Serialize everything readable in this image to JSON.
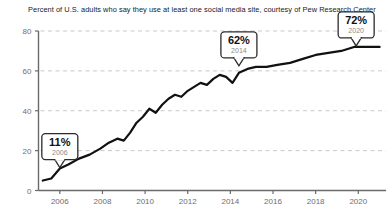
{
  "chart_data": {
    "type": "line",
    "title": "Percent of U.S. adults who say they use at least one social media site, courtesy of Pew Research Center",
    "xlabel": "",
    "ylabel": "",
    "xlim": [
      2005.0,
      2021.3
    ],
    "ylim": [
      0,
      80
    ],
    "grid": true,
    "legend": "none",
    "y_ticks": [
      0,
      20,
      40,
      60,
      80
    ],
    "y_tick_labels": [
      "0",
      "20",
      "40",
      "60",
      "80"
    ],
    "x_ticks": [
      2006,
      2008,
      2010,
      2012,
      2014,
      2016,
      2018,
      2020
    ],
    "x_tick_labels": [
      "2006",
      "2008",
      "2010",
      "2012",
      "2014",
      "2016",
      "2018",
      "2020"
    ],
    "series": [
      {
        "name": "U.S. adults using at least one social media site",
        "color": "#111111",
        "x": [
          2005.2,
          2005.6,
          2006.0,
          2006.4,
          2006.9,
          2007.4,
          2007.9,
          2008.3,
          2008.7,
          2009.0,
          2009.3,
          2009.6,
          2009.9,
          2010.2,
          2010.5,
          2010.8,
          2011.1,
          2011.4,
          2011.7,
          2012.0,
          2012.3,
          2012.6,
          2012.9,
          2013.2,
          2013.5,
          2013.8,
          2014.1,
          2014.4,
          2014.8,
          2015.2,
          2015.7,
          2016.2,
          2016.8,
          2017.4,
          2018.0,
          2018.6,
          2019.2,
          2019.8,
          2020.4,
          2021.0
        ],
        "y": [
          5,
          6,
          11,
          13,
          16,
          18,
          21,
          24,
          26,
          25,
          29,
          34,
          37,
          41,
          39,
          43,
          46,
          48,
          47,
          50,
          52,
          54,
          53,
          56,
          58,
          57,
          54,
          59,
          61,
          62,
          62,
          63,
          64,
          66,
          68,
          69,
          70,
          72,
          72,
          72
        ],
        "annotations": [
          {
            "label": "11%",
            "year": "2006",
            "x": 2006.0,
            "y": 11
          },
          {
            "label": "62%",
            "year": "2014",
            "x": 2014.4,
            "y": 62
          },
          {
            "label": "72%",
            "year": "2020",
            "x": 2019.9,
            "y": 72
          }
        ]
      }
    ]
  }
}
